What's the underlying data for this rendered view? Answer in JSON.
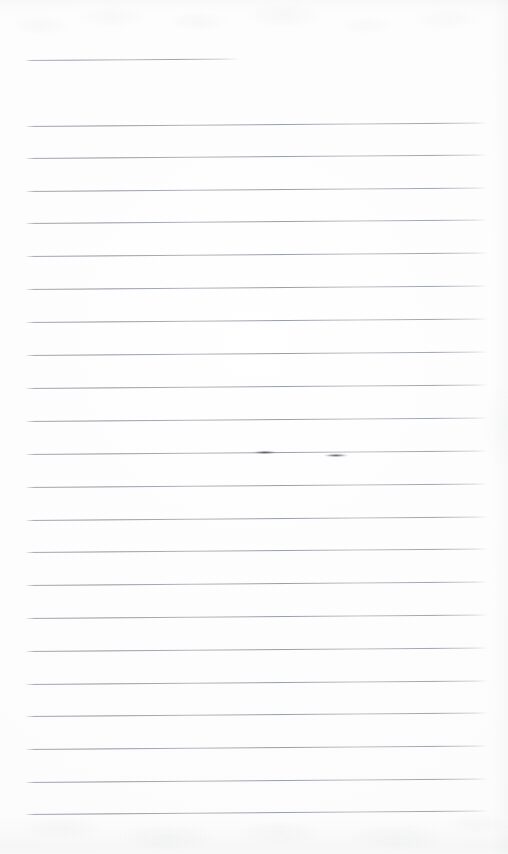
{
  "document": {
    "kind": "scanned-ruled-notebook-page",
    "title": "Blank ruled notebook page (scan)",
    "content_text": "",
    "page_width": 508,
    "page_height": 854,
    "background_color": "#fefefe",
    "paper_tone": "#fdfdfd",
    "rule_color": "#8f949c",
    "pen_mark_color": "#3a3c42",
    "rule_count": 24,
    "rule_spacing_px": 32.6,
    "rule_slant_deg": -0.42,
    "margin_left_px": 25,
    "margin_right_px": 487,
    "notes_visible": "none"
  },
  "rules": [
    {
      "index": 1,
      "y": 60,
      "x1": 25,
      "x2": 241,
      "short": true
    },
    {
      "index": 2,
      "y": 126,
      "x1": 25,
      "x2": 488,
      "short": false
    },
    {
      "index": 3,
      "y": 158,
      "x1": 25,
      "x2": 488,
      "short": false
    },
    {
      "index": 4,
      "y": 191,
      "x1": 25,
      "x2": 488,
      "short": false
    },
    {
      "index": 5,
      "y": 223,
      "x1": 25,
      "x2": 488,
      "short": false
    },
    {
      "index": 6,
      "y": 256,
      "x1": 25,
      "x2": 488,
      "short": false
    },
    {
      "index": 7,
      "y": 289,
      "x1": 25,
      "x2": 488,
      "short": false
    },
    {
      "index": 8,
      "y": 322,
      "x1": 25,
      "x2": 488,
      "short": false
    },
    {
      "index": 9,
      "y": 355,
      "x1": 25,
      "x2": 488,
      "short": false
    },
    {
      "index": 10,
      "y": 388,
      "x1": 25,
      "x2": 488,
      "short": false
    },
    {
      "index": 11,
      "y": 421,
      "x1": 25,
      "x2": 488,
      "short": false
    },
    {
      "index": 12,
      "y": 454,
      "x1": 25,
      "x2": 488,
      "short": false
    },
    {
      "index": 13,
      "y": 487,
      "x1": 25,
      "x2": 488,
      "short": false
    },
    {
      "index": 14,
      "y": 520,
      "x1": 25,
      "x2": 488,
      "short": false
    },
    {
      "index": 15,
      "y": 552,
      "x1": 25,
      "x2": 488,
      "short": false
    },
    {
      "index": 16,
      "y": 585,
      "x1": 25,
      "x2": 488,
      "short": false
    },
    {
      "index": 17,
      "y": 618,
      "x1": 25,
      "x2": 488,
      "short": false
    },
    {
      "index": 18,
      "y": 651,
      "x1": 25,
      "x2": 488,
      "short": false
    },
    {
      "index": 19,
      "y": 684,
      "x1": 25,
      "x2": 488,
      "short": false
    },
    {
      "index": 20,
      "y": 716,
      "x1": 25,
      "x2": 488,
      "short": false
    },
    {
      "index": 21,
      "y": 749,
      "x1": 25,
      "x2": 488,
      "short": false
    },
    {
      "index": 22,
      "y": 782,
      "x1": 25,
      "x2": 488,
      "short": false
    },
    {
      "index": 23,
      "y": 814,
      "x1": 25,
      "x2": 488,
      "short": false
    }
  ],
  "pen_marks": [
    {
      "index": 1,
      "x": 252,
      "y": 452,
      "width": 26
    },
    {
      "index": 2,
      "x": 323,
      "y": 455,
      "width": 26
    }
  ]
}
